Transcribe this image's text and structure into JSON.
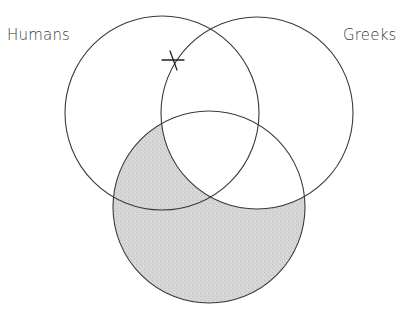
{
  "diagram": {
    "type": "venn-3-set",
    "labels": {
      "humans": "Humans",
      "greeks": "Greeks"
    },
    "sets": [
      {
        "id": "humans",
        "label": "Humans",
        "cx": 162,
        "cy": 113,
        "r": 97
      },
      {
        "id": "greeks",
        "label": "Greeks",
        "cx": 257,
        "cy": 113,
        "r": 96
      },
      {
        "id": "bottom",
        "label": "",
        "cx": 209,
        "cy": 207,
        "r": 96
      }
    ],
    "shaded_region": "bottom minus greeks",
    "marks": [
      {
        "type": "x-mark",
        "region": "humans ∩ greeks boundary (on greeks circle, inside humans)",
        "x": 173,
        "y": 62
      }
    ],
    "colors": {
      "stroke": "#3a3a3a",
      "shade": "#d3d3d3",
      "background": "#ffffff"
    }
  }
}
